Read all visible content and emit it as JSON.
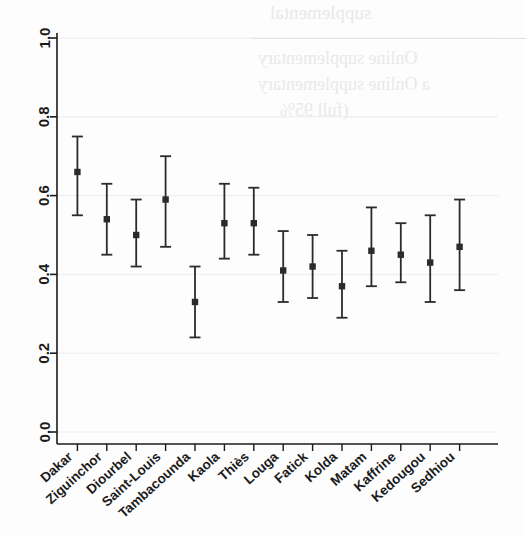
{
  "chart_data": {
    "type": "scatter",
    "title": "",
    "subtitle": "",
    "xlabel": "",
    "ylabel": "",
    "ylim": [
      0.0,
      1.0
    ],
    "yticks": [
      "0.0",
      "0.2",
      "0.4",
      "0.6",
      "0.8",
      "1.0"
    ],
    "ytick_values": [
      0.0,
      0.2,
      0.4,
      0.6,
      0.8,
      1.0
    ],
    "grid": true,
    "grid_axis": "y",
    "legend": "none",
    "marker": "square",
    "errorbars": "capped-vertical",
    "categories": [
      "Dakar",
      "Ziguinchor",
      "Diourbel",
      "Saint-Louis",
      "Tambacounda",
      "Kaola",
      "Thiès",
      "Louga",
      "Fatick",
      "Kolda",
      "Matam",
      "Kaffrine",
      "Kedougou",
      "Sedhiou"
    ],
    "values": [
      0.66,
      0.54,
      0.5,
      0.59,
      0.33,
      0.53,
      0.53,
      0.41,
      0.42,
      0.37,
      0.46,
      0.45,
      0.43,
      0.47
    ],
    "ci_lower": [
      0.55,
      0.45,
      0.42,
      0.47,
      0.24,
      0.44,
      0.45,
      0.33,
      0.34,
      0.29,
      0.37,
      0.38,
      0.33,
      0.36
    ],
    "ci_upper": [
      0.75,
      0.63,
      0.59,
      0.7,
      0.42,
      0.63,
      0.62,
      0.51,
      0.5,
      0.46,
      0.57,
      0.53,
      0.55,
      0.59
    ],
    "points": [
      {
        "label": "Dakar",
        "value": 0.66,
        "lo": 0.55,
        "hi": 0.75
      },
      {
        "label": "Ziguinchor",
        "value": 0.54,
        "lo": 0.45,
        "hi": 0.63
      },
      {
        "label": "Diourbel",
        "value": 0.5,
        "lo": 0.42,
        "hi": 0.59
      },
      {
        "label": "Saint-Louis",
        "value": 0.59,
        "lo": 0.47,
        "hi": 0.7
      },
      {
        "label": "Tambacounda",
        "value": 0.33,
        "lo": 0.24,
        "hi": 0.42
      },
      {
        "label": "Kaola",
        "value": 0.53,
        "lo": 0.44,
        "hi": 0.63
      },
      {
        "label": "Thiès",
        "value": 0.53,
        "lo": 0.45,
        "hi": 0.62
      },
      {
        "label": "Louga",
        "value": 0.41,
        "lo": 0.33,
        "hi": 0.51
      },
      {
        "label": "Fatick",
        "value": 0.42,
        "lo": 0.34,
        "hi": 0.5
      },
      {
        "label": "Kolda",
        "value": 0.37,
        "lo": 0.29,
        "hi": 0.46
      },
      {
        "label": "Matam",
        "value": 0.46,
        "lo": 0.37,
        "hi": 0.57
      },
      {
        "label": "Kaffrine",
        "value": 0.45,
        "lo": 0.38,
        "hi": 0.53
      },
      {
        "label": "Kedougou",
        "value": 0.43,
        "lo": 0.33,
        "hi": 0.55
      },
      {
        "label": "Sedhiou",
        "value": 0.47,
        "lo": 0.36,
        "hi": 0.59
      }
    ],
    "colors": {
      "marker": "#2b2b2b",
      "errorbar": "#2b2b2b",
      "axis": "#1b1b1b",
      "grid": "#ececec",
      "background": "#fdfdfd"
    }
  },
  "background_bleed": {
    "lines": [
      "supplemental",
      "Online supplementary",
      "a  Online supplementary",
      "(full 95%"
    ]
  }
}
